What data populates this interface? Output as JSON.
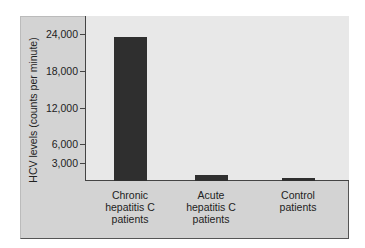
{
  "chart_data": {
    "type": "bar",
    "title": "",
    "xlabel": "",
    "ylabel": "HCV levels (counts per minute)",
    "categories": [
      "Chronic hepatitis C patients",
      "Acute hepatitis C patients",
      "Control patients"
    ],
    "category_lines": [
      [
        "Chronic",
        "hepatitis C",
        "patients"
      ],
      [
        "Acute",
        "hepatitis C",
        "patients"
      ],
      [
        "Control",
        "patients"
      ]
    ],
    "values": [
      23500,
      1000,
      500
    ],
    "ylim": [
      0,
      24000
    ],
    "yticks": [
      3000,
      6000,
      12000,
      18000,
      24000
    ],
    "ytick_labels": [
      "3,000",
      "6,000",
      "12,000",
      "18,000",
      "24,000"
    ],
    "grid": false,
    "legend": null,
    "colors": {
      "bar": "#2f2f2f",
      "plot_bg": "#e8e8e8",
      "panel_bg": "#d3d3d3"
    }
  }
}
